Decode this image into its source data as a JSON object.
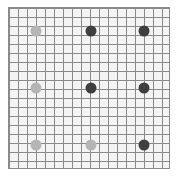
{
  "board": {
    "rows": 18,
    "cols": 18,
    "grid_color": "#8a8a8a",
    "background": "#f4f4f4"
  },
  "colors": {
    "light": "#b5b5b5",
    "dark": "#3f3f3f"
  },
  "dots": [
    {
      "x": 36,
      "y": 31,
      "color": "light"
    },
    {
      "x": 91,
      "y": 31,
      "color": "dark"
    },
    {
      "x": 144,
      "y": 31,
      "color": "dark"
    },
    {
      "x": 36,
      "y": 88,
      "color": "light"
    },
    {
      "x": 91,
      "y": 88,
      "color": "dark"
    },
    {
      "x": 144,
      "y": 88,
      "color": "dark"
    },
    {
      "x": 36,
      "y": 145,
      "color": "light"
    },
    {
      "x": 91,
      "y": 145,
      "color": "light"
    },
    {
      "x": 144,
      "y": 145,
      "color": "dark"
    }
  ]
}
